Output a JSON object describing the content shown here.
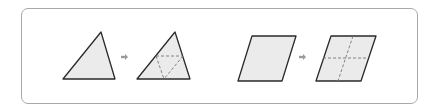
{
  "diagram": {
    "colors": {
      "frame": "#a9a9a9",
      "shape_fill": "#ebebeb",
      "shape_stroke": "#2a2a2a",
      "dash_stroke": "#777777",
      "arrow": "#9a9a9a"
    },
    "groups": [
      {
        "name": "triangle",
        "before": {
          "shape": "triangle",
          "points": [
            [
              101,
              32
            ],
            [
              115,
              79
            ],
            [
              63,
              79
            ]
          ]
        },
        "arrow": {
          "x": 124,
          "y": 57
        },
        "after": {
          "shape": "triangle",
          "points": [
            [
              175,
              32
            ],
            [
              190,
              79
            ],
            [
              137,
              79
            ]
          ],
          "dashed_lines": [
            [
              [
                156,
                56
              ],
              [
                183,
                56
              ]
            ],
            [
              [
                156,
                56
              ],
              [
                164,
                79
              ]
            ],
            [
              [
                183,
                56
              ],
              [
                164,
                79
              ]
            ]
          ]
        }
      },
      {
        "name": "parallelogram",
        "before": {
          "shape": "parallelogram",
          "points": [
            [
              252,
              36
            ],
            [
              296,
              36
            ],
            [
              282,
              81
            ],
            [
              238,
              81
            ]
          ]
        },
        "arrow": {
          "x": 302,
          "y": 57
        },
        "after": {
          "shape": "parallelogram",
          "points": [
            [
              331,
              36
            ],
            [
              376,
              36
            ],
            [
              361,
              81
            ],
            [
              316,
              81
            ]
          ],
          "dashed_lines": [
            [
              [
                323,
                58
              ],
              [
                368,
                58
              ]
            ],
            [
              [
                353,
                36
              ],
              [
                338,
                81
              ]
            ]
          ]
        }
      }
    ]
  }
}
